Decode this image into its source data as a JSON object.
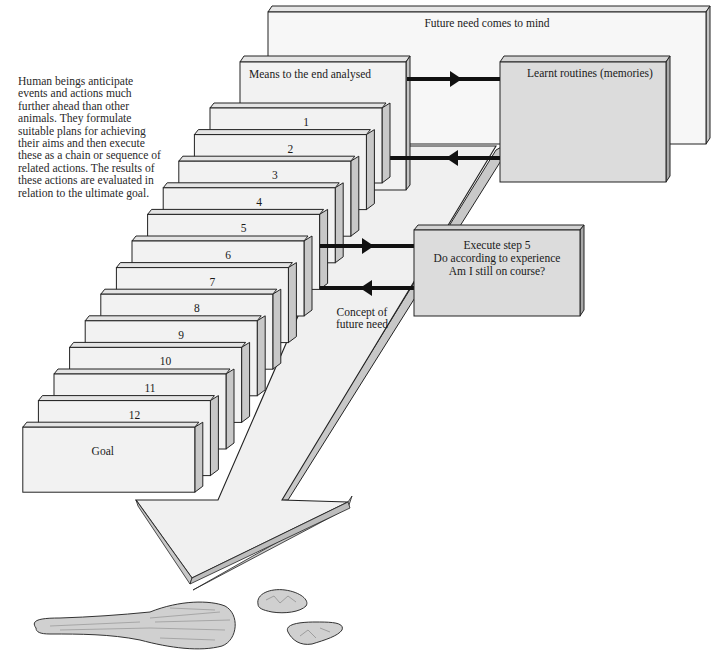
{
  "caption": {
    "lines": [
      "Human beings anticipate",
      "events and actions much",
      "further ahead than other",
      "animals. They formulate",
      "suitable plans for achieving",
      "their aims and then execute",
      "these as a chain or sequence of",
      "related actions. The results of",
      "these actions are evaluated in",
      "relation to the ultimate goal."
    ]
  },
  "boxes": {
    "future_need": "Future need comes to mind",
    "means": "Means to the end analysed",
    "learnt_routines": "Learnt routines (memories)",
    "execute": {
      "lines": [
        "Execute step 5",
        "Do according to experience",
        "Am I still on course?"
      ]
    },
    "concept": {
      "lines": [
        "Concept of",
        "future need"
      ]
    }
  },
  "steps": [
    "1",
    "2",
    "3",
    "4",
    "5",
    "6",
    "7",
    "8",
    "9",
    "10",
    "11",
    "12"
  ],
  "goal": "Goal",
  "colors": {
    "panel_light": "#f1f1f1",
    "panel_gray": "#dcdcdc",
    "side_shade": "#c4c4c4",
    "outline": "#222222",
    "arrow_line": "#111111"
  },
  "artifacts": [
    "wooden-spoon",
    "stone-fragment-upper",
    "stone-fragment-lower"
  ]
}
